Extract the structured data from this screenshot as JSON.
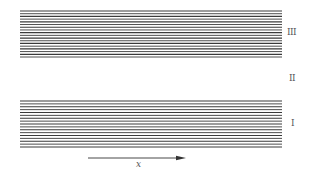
{
  "regions": [
    {
      "id": "I",
      "label": "I",
      "lines": 17
    },
    {
      "id": "II",
      "label": "II",
      "lines": 0
    },
    {
      "id": "III",
      "label": "III",
      "lines": 18
    }
  ],
  "axis": {
    "label": "x",
    "direction": "right"
  },
  "colors": {
    "line": "#3a3a3a",
    "background": "#ffffff"
  }
}
